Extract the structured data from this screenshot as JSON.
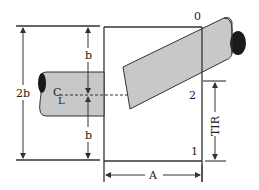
{
  "diagram": {
    "type": "technical-drawing",
    "labels": {
      "two_b": "2b",
      "b_upper": "b",
      "b_lower": "b",
      "centerline_c": "C",
      "centerline_l": "L",
      "point_0": "0",
      "point_1": "1",
      "point_2": "2",
      "tir": "TIR",
      "a": "A"
    },
    "colors": {
      "line": "#333333",
      "shaft_fill": "#c8c8c8",
      "shaft_end": "#1a1a1a"
    }
  }
}
